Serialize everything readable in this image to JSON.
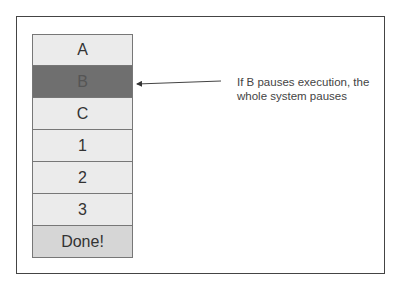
{
  "diagram": {
    "stack": [
      {
        "label": "A",
        "style": "normal"
      },
      {
        "label": "B",
        "style": "highlighted"
      },
      {
        "label": "C",
        "style": "normal"
      },
      {
        "label": "1",
        "style": "normal"
      },
      {
        "label": "2",
        "style": "normal"
      },
      {
        "label": "3",
        "style": "normal"
      },
      {
        "label": "Done!",
        "style": "done"
      }
    ],
    "annotation": {
      "line1": "If B pauses execution, the",
      "line2": "whole system pauses",
      "points_to": "B"
    },
    "colors": {
      "cell": "#ebebeb",
      "highlighted": "#6f6f6f",
      "done": "#d6d6d6",
      "border": "#444444"
    }
  }
}
